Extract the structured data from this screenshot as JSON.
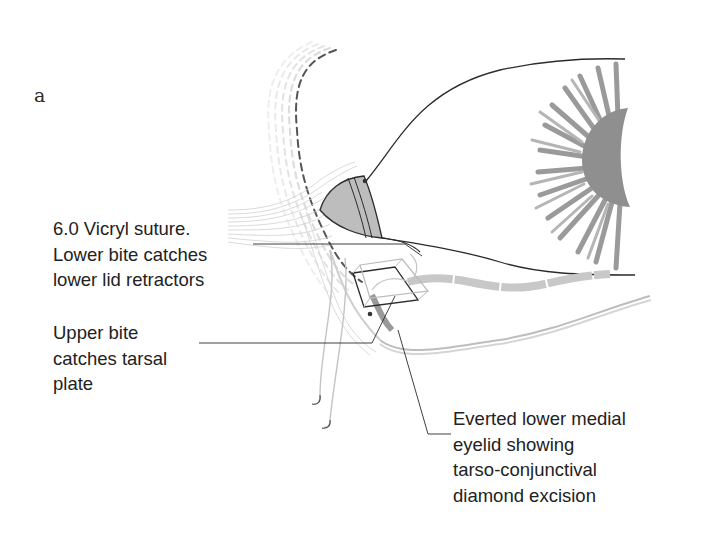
{
  "figure": {
    "panel_letter": "a",
    "labels": {
      "suture": {
        "lines": [
          "6.0 Vicryl suture.",
          "Lower bite catches",
          "lower lid retractors"
        ]
      },
      "upper_bite": {
        "lines": [
          "Upper bite",
          "catches tarsal",
          "plate"
        ]
      },
      "everted": {
        "lines": [
          "Everted lower medial",
          "eyelid showing",
          "tarso-conjunctival",
          "diamond excision"
        ]
      }
    },
    "colors": {
      "line": "#2b2b2b",
      "iris": "#9a9a9a",
      "pupil": "#8f8f8f",
      "tissue_light": "#cfcfcf",
      "tissue_mid": "#b8b8b8",
      "dash": "#8a8a8a"
    }
  }
}
